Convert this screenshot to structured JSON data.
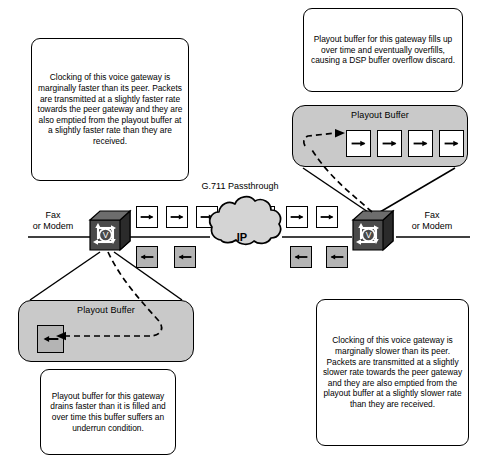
{
  "diagram": {
    "center_label": "G.711 Passthrough",
    "cloud_label": "IP",
    "endpoint_left": "Fax\nor Modem",
    "endpoint_right": "Fax\nor Modem",
    "colors": {
      "buffer_fill": "#c9c9c9",
      "packet_forward_fill": "#ffffff",
      "packet_return_fill": "#b4b4b4",
      "stroke": "#000000",
      "background": "#ffffff"
    }
  },
  "notes": {
    "top_left": "Clocking of this voice gateway is marginally faster than its peer. Packets are transmitted at a slightly faster rate towards the peer gateway and they are also emptied from the playout buffer at a slightly faster rate than they are received.",
    "top_right": "Playout buffer for this gateway fills up over time and eventually overfills, causing a DSP buffer overflow discard.",
    "bottom_left": "Playout buffer for this gateway drains faster than it is filled and over time this buffer suffers an underrun condition.",
    "bottom_right": "Clocking of this voice gateway is marginally slower than its peer. Packets are transmitted at a slightly slower rate towards the peer gateway and they are also emptied from the playout buffer at a slightly slower rate than they are received."
  },
  "buffers": {
    "right": {
      "title": "Playout Buffer",
      "state": "overflow",
      "packet_count": 4,
      "packet_direction": "right",
      "packet_fill": "#ffffff"
    },
    "left": {
      "title": "Playout Buffer",
      "state": "underrun",
      "packet_count": 1,
      "packet_direction": "left",
      "packet_fill": "#b4b4b4"
    }
  },
  "gateways": {
    "left": {
      "name": "voice-gateway-left",
      "icon": "router-voice-cube-icon",
      "clocking": "faster"
    },
    "right": {
      "name": "voice-gateway-right",
      "icon": "router-voice-cube-icon",
      "clocking": "slower"
    }
  },
  "packet_streams": {
    "forward": {
      "direction": "right",
      "label": "G.711 Passthrough",
      "count": 7,
      "fill": "#ffffff"
    },
    "return": {
      "direction": "left",
      "count": 4,
      "fill": "#b4b4b4"
    }
  },
  "icons": {
    "arrow_right": "arrow-right-icon",
    "arrow_left": "arrow-left-icon",
    "cloud": "ip-cloud-icon",
    "router": "router-voice-cube-icon"
  }
}
